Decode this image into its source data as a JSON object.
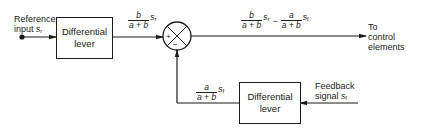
{
  "diagram": {
    "type": "block-diagram",
    "reference_input": {
      "label_line1": "Reference",
      "label_line2": "input",
      "symbol": "s",
      "subscript": "r"
    },
    "top_block": {
      "line1": "Differential",
      "line2": "lever"
    },
    "top_signal": {
      "num": "b",
      "den": "a + b",
      "symbol": "s",
      "subscript": "r"
    },
    "summing_junction": {
      "plus": "+",
      "minus": "−"
    },
    "output_signal": {
      "term1": {
        "num": "b",
        "den": "a + b",
        "symbol": "s",
        "subscript": "r"
      },
      "operator": "−",
      "term2": {
        "num": "a",
        "den": "a + b",
        "symbol": "s",
        "subscript": "f"
      }
    },
    "output_label": {
      "line1": "To",
      "line2": "control",
      "line3": "elements"
    },
    "feedback_block": {
      "line1": "Differential",
      "line2": "lever"
    },
    "feedback_signal": {
      "num": "a",
      "den": "a + b",
      "symbol": "s",
      "subscript": "f"
    },
    "feedback_input": {
      "label_line1": "Feedback",
      "label_line2": "signal",
      "symbol": "s",
      "subscript": "f"
    },
    "colors": {
      "line": "#1a1a1a",
      "background": "#ffffff"
    }
  }
}
